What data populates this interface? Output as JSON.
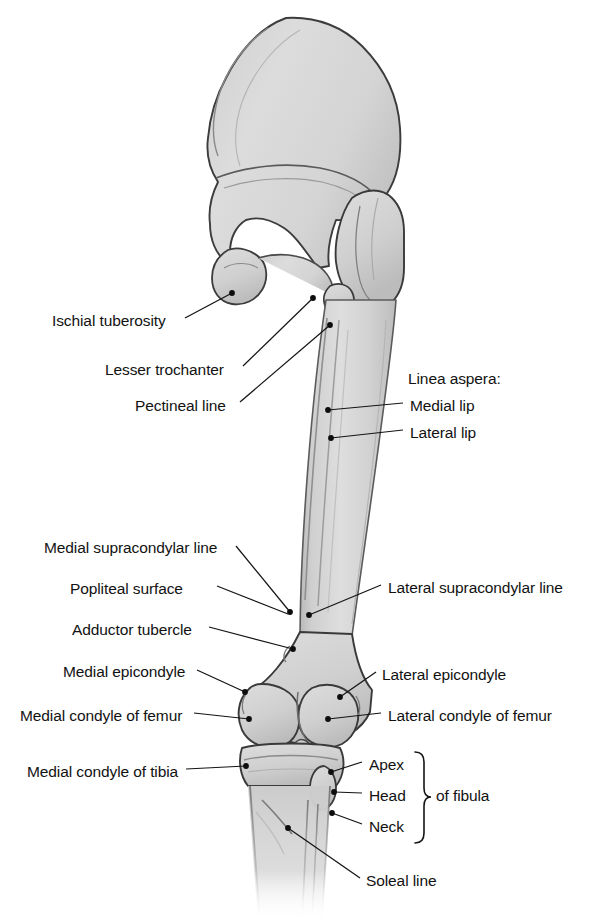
{
  "figure": {
    "view": "posterior",
    "colors": {
      "bone_fill": "#d2d2d2",
      "bone_fill_light": "#dcdcdc",
      "bone_outline": "#3a3a3a",
      "leader_line": "#1a1a1a",
      "label_text": "#121212",
      "background": "#ffffff"
    }
  },
  "labels_left": [
    {
      "id": "ischial-tuberosity",
      "text": "Ischial tuberosity",
      "text_x": 52,
      "text_y": 322,
      "anchor_x": 232,
      "anchor_y": 293
    },
    {
      "id": "lesser-trochanter",
      "text": "Lesser trochanter",
      "text_x": 105,
      "text_y": 371,
      "anchor_x": 313,
      "anchor_y": 298
    },
    {
      "id": "pectineal-line",
      "text": "Pectineal line",
      "text_x": 135,
      "text_y": 407,
      "anchor_x": 330,
      "anchor_y": 325
    },
    {
      "id": "medial-supracondylar-line",
      "text": "Medial supracondylar line",
      "text_x": 44,
      "text_y": 549,
      "anchor_x": 290,
      "anchor_y": 612
    },
    {
      "id": "popliteal-surface",
      "text": "Popliteal surface",
      "text_x": 97,
      "text_y": 590,
      "anchor_x": 288,
      "anchor_y": 614
    },
    {
      "id": "adductor-tubercle",
      "text": "Adductor tubercle",
      "text_x": 72,
      "text_y": 631,
      "anchor_x": 293,
      "anchor_y": 649
    },
    {
      "id": "medial-epicondyle",
      "text": "Medial epicondyle",
      "text_x": 63,
      "text_y": 673,
      "anchor_x": 245,
      "anchor_y": 692
    },
    {
      "id": "medial-condyle-of-femur",
      "text": "Medial condyle of femur",
      "text_x": 20,
      "text_y": 717,
      "anchor_x": 249,
      "anchor_y": 719
    },
    {
      "id": "medial-condyle-of-tibia",
      "text": "Medial condyle of tibia",
      "text_x": 27,
      "text_y": 773,
      "anchor_x": 246,
      "anchor_y": 766
    }
  ],
  "labels_right": [
    {
      "id": "linea-aspera-heading",
      "text": "Linea aspera:",
      "text_x": 408,
      "text_y": 380,
      "leader": false
    },
    {
      "id": "medial-lip",
      "text": "Medial lip",
      "text_x": 410,
      "text_y": 407,
      "anchor_x": 328,
      "anchor_y": 410,
      "leader": true
    },
    {
      "id": "lateral-lip",
      "text": "Lateral lip",
      "text_x": 410,
      "text_y": 434,
      "anchor_x": 331,
      "anchor_y": 438,
      "leader": true
    },
    {
      "id": "lateral-supracondylar-line",
      "text": "Lateral supracondylar line",
      "text_x": 388,
      "text_y": 589,
      "anchor_x": 309,
      "anchor_y": 615,
      "leader": true
    },
    {
      "id": "lateral-epicondyle",
      "text": "Lateral epicondyle",
      "text_x": 382,
      "text_y": 676,
      "anchor_x": 340,
      "anchor_y": 697,
      "leader": true
    },
    {
      "id": "lateral-condyle-of-femur",
      "text": "Lateral condyle of femur",
      "text_x": 388,
      "text_y": 717,
      "anchor_x": 328,
      "anchor_y": 719,
      "leader": true
    },
    {
      "id": "apex",
      "text": "Apex",
      "text_x": 369,
      "text_y": 766,
      "anchor_x": 331,
      "anchor_y": 772,
      "leader": true
    },
    {
      "id": "head",
      "text": "Head",
      "text_x": 369,
      "text_y": 797,
      "anchor_x": 334,
      "anchor_y": 792,
      "leader": true
    },
    {
      "id": "neck",
      "text": "Neck",
      "text_x": 369,
      "text_y": 828,
      "anchor_x": 332,
      "anchor_y": 813,
      "leader": true
    },
    {
      "id": "of-fibula",
      "text": "of fibula",
      "text_x": 436,
      "text_y": 797,
      "leader": false
    },
    {
      "id": "soleal-line",
      "text": "Soleal line",
      "text_x": 366,
      "text_y": 882,
      "anchor_x": 288,
      "anchor_y": 828,
      "leader": true
    }
  ],
  "brace": {
    "id": "fibula-brace",
    "label": "curly-brace",
    "x": 415,
    "y_top": 752,
    "y_bottom": 843
  }
}
